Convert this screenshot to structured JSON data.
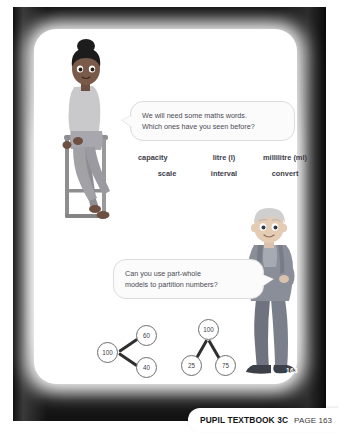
{
  "slide": {
    "corner_page_number": "163"
  },
  "bubbles": {
    "vocab": {
      "line1": "We will need some maths words.",
      "line2": "Which ones have you seen before?"
    },
    "partwhole": {
      "line1": "Can you use part-whole",
      "line2": "models to partition numbers?"
    }
  },
  "vocabulary": {
    "row1": [
      "capacity",
      "litre (l)",
      "millilitre (ml)"
    ],
    "row2": [
      "scale",
      "interval",
      "convert"
    ]
  },
  "part_whole_models": [
    {
      "orientation": "horizontal",
      "whole": "100",
      "parts": [
        "60",
        "40"
      ]
    },
    {
      "orientation": "vertical",
      "whole": "100",
      "parts": [
        "25",
        "75"
      ]
    }
  ],
  "characters": {
    "girl": "girl-sitting-on-stool-illustration",
    "boy": "boy-standing-arms-crossed-illustration"
  },
  "footer": {
    "title": "PUPIL TEXTBOOK 3C",
    "page": "PAGE 163"
  },
  "colors": {
    "frame_dark": "#111111",
    "panel": "#ffffff",
    "bubble_fill": "#fbfbfb",
    "bubble_border": "#dcdcdc",
    "text": "#3e3e4a"
  }
}
